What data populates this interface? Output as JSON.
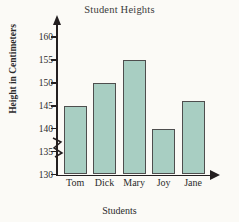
{
  "chart_data": {
    "type": "bar",
    "title": "Student Heights",
    "xlabel": "Students",
    "ylabel": "Height in Centimeters",
    "categories": [
      "Tom",
      "Dick",
      "Mary",
      "Joy",
      "Jane"
    ],
    "values": [
      145,
      150,
      155,
      140,
      146
    ],
    "ylim": [
      130,
      162
    ],
    "yticks": [
      130,
      135,
      140,
      145,
      150,
      155,
      160
    ],
    "ytick_labels": [
      "130",
      "135",
      "140",
      "145",
      "150",
      "155",
      "160"
    ],
    "axis_break": true,
    "axis_break_note": "zigzag break on y-axis below 130",
    "grid": false,
    "legend": null,
    "bar_fill_color": "#a8cec2",
    "bar_edge_color": "#4e4e4e",
    "axis_color": "#231f20",
    "background_color": "#fbfaf6",
    "y_arrow": true,
    "x_arrow": true
  },
  "icons": {
    "y_axis_arrow": "arrow-up-icon",
    "x_axis_arrow": "arrow-right-icon",
    "break": "axis-break-zigzag-icon"
  }
}
